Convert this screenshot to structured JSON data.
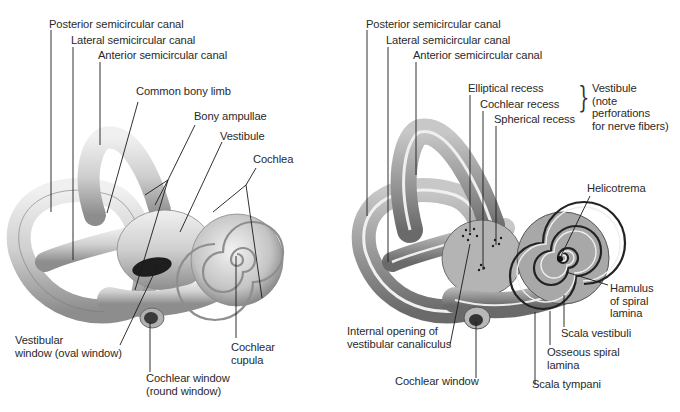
{
  "figure": {
    "left_panel": {
      "name": "Bony labyrinth (external view)",
      "labels": [
        {
          "id": "post",
          "text": "Posterior semicircular canal"
        },
        {
          "id": "lat",
          "text": "Lateral semicircular canal"
        },
        {
          "id": "ant",
          "text": "Anterior semicircular canal"
        },
        {
          "id": "common",
          "text": "Common bony limb"
        },
        {
          "id": "ampullae",
          "text": "Bony ampullae"
        },
        {
          "id": "vestibule",
          "text": "Vestibule"
        },
        {
          "id": "cochlea",
          "text": "Cochlea"
        },
        {
          "id": "oval",
          "text": "Vestibular\nwindow (oval window)"
        },
        {
          "id": "round",
          "text": "Cochlear window\n(round window)"
        },
        {
          "id": "cupula",
          "text": "Cochlear\ncupula"
        }
      ]
    },
    "right_panel": {
      "name": "Bony labyrinth (opened view)",
      "labels": [
        {
          "id": "post",
          "text": "Posterior semicircular canal"
        },
        {
          "id": "lat",
          "text": "Lateral semicircular canal"
        },
        {
          "id": "ant",
          "text": "Anterior semicircular canal"
        },
        {
          "id": "elliptical",
          "text": "Elliptical recess"
        },
        {
          "id": "cochlear_recess",
          "text": "Cochlear recess"
        },
        {
          "id": "spherical",
          "text": "Spherical recess"
        },
        {
          "id": "vestibule_note",
          "text": "Vestibule\n(note\nperforations\nfor nerve fibers)"
        },
        {
          "id": "helicotrema",
          "text": "Helicotrema"
        },
        {
          "id": "hamulus",
          "text": "Hamulus\nof spiral\nlamina"
        },
        {
          "id": "scala_vestibuli",
          "text": "Scala vestibuli"
        },
        {
          "id": "osseous",
          "text": "Osseous spiral\nlamina"
        },
        {
          "id": "scala_tympani",
          "text": "Scala tympani"
        },
        {
          "id": "internal_opening",
          "text": "Internal opening of\nvestibular canaliculus"
        },
        {
          "id": "cochlear_window",
          "text": "Cochlear window"
        }
      ]
    },
    "colors": {
      "bone_light": "#e4e4e4",
      "bone_mid": "#b8b8b8",
      "bone_dark": "#6e6e6e",
      "leader_line": "#1a1a1a",
      "text": "#2a2a2a"
    }
  }
}
